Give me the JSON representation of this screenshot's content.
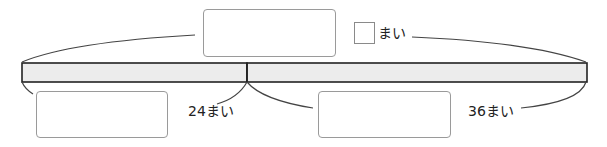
{
  "diagram": {
    "type": "tape-diagram",
    "colors": {
      "bar_fill": "#ececec",
      "bar_stroke": "#222222",
      "box_stroke": "#9a9a9a",
      "curve_stroke": "#444444"
    },
    "total": {
      "answer_box": "",
      "small_box": "",
      "unit": "まい"
    },
    "segments": [
      {
        "value_label": "24まい",
        "answer_box": ""
      },
      {
        "value_label": "36まい",
        "answer_box": ""
      }
    ]
  }
}
